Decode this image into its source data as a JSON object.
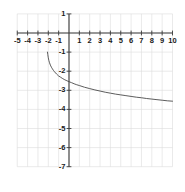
{
  "chart_data": {
    "type": "line",
    "title": "",
    "subtitle": "",
    "xlabel": "",
    "ylabel": "",
    "xlim": [
      -5,
      10
    ],
    "ylim": [
      -7,
      1
    ],
    "xticks": [
      -5,
      -4,
      -3,
      -2,
      -1,
      1,
      2,
      3,
      4,
      5,
      6,
      7,
      8,
      9,
      10
    ],
    "yticks": [
      1,
      -1,
      -2,
      -3,
      -4,
      -5,
      -6,
      -7
    ],
    "xtick_labels": [
      "-5",
      "-4",
      "-3",
      "-2",
      "-1",
      "1",
      "2",
      "3",
      "4",
      "5",
      "6",
      "7",
      "8",
      "9",
      "10"
    ],
    "ytick_labels": [
      "1",
      "-1",
      "-2",
      "-3",
      "-4",
      "-5",
      "-6",
      "-7"
    ],
    "grid": true,
    "grid_color": "#dcdcdc",
    "axis_color": "#3a3a3a",
    "curve_color": "#4a4a4a",
    "legend": null,
    "legend_position": "none",
    "series": [
      {
        "name": "curve",
        "x": [
          -2.08,
          -2.05,
          -2.0,
          -1.95,
          -1.9,
          -1.8,
          -1.7,
          -1.6,
          -1.5,
          -1.4,
          -1.2,
          -1.0,
          -0.8,
          -0.6,
          -0.4,
          -0.2,
          0.0,
          0.25,
          0.5,
          0.75,
          1.0,
          1.5,
          2.0,
          2.5,
          3.0,
          3.5,
          4.0,
          4.5,
          5.0,
          5.5,
          6.0,
          6.5,
          7.0,
          7.5,
          8.0,
          8.5,
          9.0,
          9.5,
          10.0
        ],
        "y": [
          -1.0,
          -1.12,
          -1.3,
          -1.43,
          -1.53,
          -1.68,
          -1.79,
          -1.88,
          -1.96,
          -2.03,
          -2.15,
          -2.25,
          -2.32,
          -2.39,
          -2.45,
          -2.5,
          -2.55,
          -2.6,
          -2.66,
          -2.71,
          -2.75,
          -2.84,
          -2.91,
          -2.98,
          -3.04,
          -3.1,
          -3.15,
          -3.2,
          -3.24,
          -3.28,
          -3.32,
          -3.36,
          -3.39,
          -3.43,
          -3.46,
          -3.49,
          -3.52,
          -3.55,
          -3.57
        ],
        "note": "decreasing logarithmic-type curve with vertical asymptote near x = -2.1"
      }
    ]
  },
  "axes": {
    "x_axis_name": "x-axis",
    "y_axis_name": "y-axis"
  }
}
